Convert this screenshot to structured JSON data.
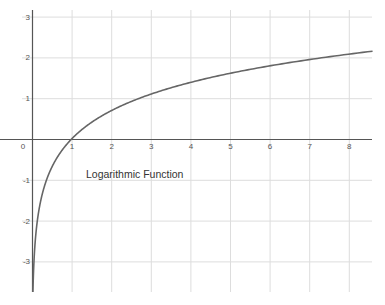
{
  "chart_data": {
    "type": "line",
    "title": "Logarithmic Function",
    "xlabel": "",
    "ylabel": "",
    "function": "y = ln(x)",
    "xlim": [
      0,
      8.6
    ],
    "ylim": [
      -3.7,
      3.2
    ],
    "grid": true,
    "legend": "none",
    "x_ticks": [
      0,
      1,
      2,
      3,
      4,
      5,
      6,
      7,
      8
    ],
    "y_ticks": [
      -3,
      -2,
      -1,
      1,
      2,
      3
    ],
    "x_tick_labels": [
      "0",
      "1",
      "2",
      "3",
      "4",
      "5",
      "6",
      "7",
      "8"
    ],
    "y_tick_labels": [
      "-3",
      "-2",
      "-1",
      "1",
      "2",
      "3"
    ],
    "series": [
      {
        "name": "ln(x)",
        "x": [
          0.025,
          0.05,
          0.1,
          0.2,
          0.3,
          0.5,
          0.75,
          1,
          1.5,
          2,
          3,
          4,
          5,
          6,
          7,
          8,
          8.6
        ],
        "values": [
          -3.69,
          -3.0,
          -2.3,
          -1.61,
          -1.2,
          -0.69,
          -0.29,
          0,
          0.41,
          0.69,
          1.1,
          1.39,
          1.61,
          1.79,
          1.95,
          2.08,
          2.15
        ]
      }
    ],
    "annotations": [
      {
        "text": "Logarithmic Function",
        "x": 1.35,
        "y": -0.95
      }
    ],
    "colors": {
      "curve": "#666666",
      "axis": "#555555",
      "grid": "#dddddd"
    }
  }
}
